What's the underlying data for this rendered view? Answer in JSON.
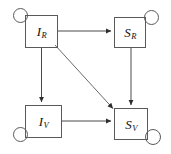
{
  "figure": {
    "type": "state-transition-diagram",
    "width": 171,
    "height": 154,
    "background_color": "#ffffff",
    "stroke_color": "#5a5a5a",
    "arrow_color": "#3a3a3a",
    "text_color": "#121212"
  },
  "nodes": [
    {
      "id": "IR",
      "base": "I",
      "sub": "R",
      "label": "I_R",
      "position": "top-left",
      "box": {
        "x": 25,
        "y": 15,
        "w": 33,
        "h": 33
      },
      "self_loop": {
        "x": 13,
        "y": 8,
        "w": 15,
        "h": 15,
        "corner": "top-left"
      }
    },
    {
      "id": "SR",
      "base": "S",
      "sub": "R",
      "label": "S_R",
      "position": "top-right",
      "box": {
        "x": 114,
        "y": 17,
        "w": 32,
        "h": 31
      },
      "self_loop": {
        "x": 144,
        "y": 10,
        "w": 15,
        "h": 15,
        "corner": "top-right"
      }
    },
    {
      "id": "IV",
      "base": "I",
      "sub": "V",
      "label": "I_V",
      "position": "bottom-left",
      "box": {
        "x": 25,
        "y": 105,
        "w": 37,
        "h": 33
      },
      "self_loop": {
        "x": 13,
        "y": 127,
        "w": 15,
        "h": 15,
        "corner": "bottom-left"
      }
    },
    {
      "id": "SV",
      "base": "S",
      "sub": "V",
      "label": "S_V",
      "position": "bottom-right",
      "box": {
        "x": 114,
        "y": 108,
        "w": 34,
        "h": 32
      },
      "self_loop": {
        "x": 145,
        "y": 129,
        "w": 16,
        "h": 16,
        "corner": "bottom-right"
      }
    }
  ],
  "edges": [
    {
      "id": "IR-to-SR",
      "from": "IR",
      "to": "SR",
      "kind": "horizontal",
      "arrowhead": true,
      "x1": 58,
      "y1": 31,
      "x2": 112,
      "y2": 31
    },
    {
      "id": "IR-to-IV",
      "from": "IR",
      "to": "IV",
      "kind": "vertical",
      "arrowhead": true,
      "x1": 41,
      "y1": 48,
      "x2": 41,
      "y2": 103
    },
    {
      "id": "SR-to-SV",
      "from": "SR",
      "to": "SV",
      "kind": "vertical",
      "arrowhead": true,
      "x1": 131,
      "y1": 48,
      "x2": 131,
      "y2": 106
    },
    {
      "id": "IV-to-SV",
      "from": "IV",
      "to": "SV",
      "kind": "horizontal",
      "arrowhead": true,
      "x1": 62,
      "y1": 121,
      "x2": 112,
      "y2": 121
    },
    {
      "id": "IR-to-SV",
      "from": "IR",
      "to": "SV",
      "kind": "diagonal",
      "arrowhead": true,
      "x1": 55,
      "y1": 45,
      "x2": 114,
      "y2": 109
    }
  ],
  "accessibility": {
    "description": "Four labelled boxes arranged in a square with self-loop circles at their outer corners and directed arrows between them."
  }
}
